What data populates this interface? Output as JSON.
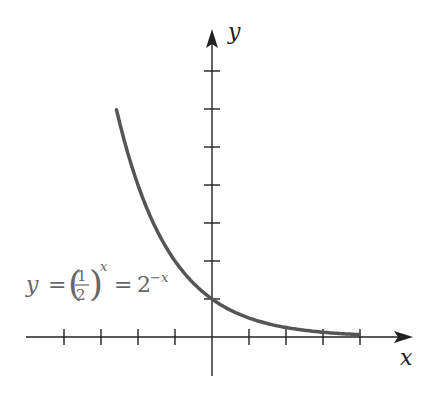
{
  "chart_data": {
    "type": "line",
    "title": "",
    "function": "y = (1/2)^x = 2^(-x)",
    "xlabel": "x",
    "ylabel": "y",
    "xlim": [
      -5.5,
      5.4
    ],
    "ylim": [
      -1,
      8
    ],
    "x_ticks": [
      -4,
      -3,
      -2,
      -1,
      1,
      2,
      3,
      4
    ],
    "y_ticks": [
      1,
      2,
      3,
      4,
      5,
      6,
      7
    ],
    "tick_labels_shown": false,
    "grid": false,
    "series": [
      {
        "name": "y = (1/2)^x",
        "x": [
          -2.58,
          -2,
          -1.5,
          -1,
          -0.5,
          0,
          0.5,
          1,
          1.5,
          2,
          2.5,
          3,
          3.5,
          4
        ],
        "values": [
          6.0,
          4.0,
          2.83,
          2.0,
          1.41,
          1.0,
          0.71,
          0.5,
          0.35,
          0.25,
          0.18,
          0.125,
          0.088,
          0.0625
        ]
      }
    ],
    "annotations": [
      {
        "text": "y = (1/2)^x = 2^{-x}",
        "x": -4.8,
        "y": 0.95
      }
    ]
  },
  "labels": {
    "x_axis": "x",
    "y_axis": "y",
    "eq_y": "y",
    "eq_equals1": "=",
    "eq_num": "1",
    "eq_den": "2",
    "eq_exp": "x",
    "eq_equals2": "=",
    "eq_base": "2",
    "eq_neg_exp": "−x"
  },
  "colors": {
    "axis": "#222222",
    "curve": "#555555",
    "label": "#666666"
  }
}
